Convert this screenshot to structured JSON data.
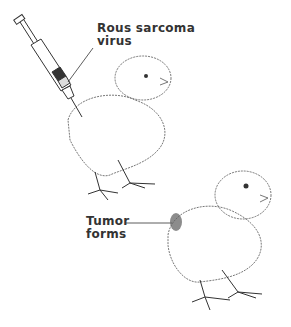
{
  "diagram": {
    "labels": {
      "virus_line1": "Rous sarcoma",
      "virus_line2": "virus",
      "tumor_line1": "Tumor",
      "tumor_line2": "forms"
    },
    "colors": {
      "ink": "#333333",
      "background": "#ffffff",
      "tumor_shade": "#555555"
    },
    "elements": [
      {
        "name": "syringe",
        "description": "syringe injecting chick"
      },
      {
        "name": "chick-injected",
        "description": "chick receiving injection"
      },
      {
        "name": "chick-with-tumor",
        "description": "chick with tumor on side"
      }
    ]
  }
}
